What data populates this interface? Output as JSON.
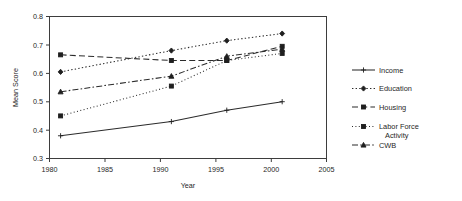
{
  "chart_data": {
    "type": "line",
    "title": "",
    "subtitle": "",
    "xlabel": "Year",
    "ylabel": "Mean Score",
    "x": [
      1981,
      1991,
      1996,
      2001
    ],
    "xlim": [
      1980,
      2005
    ],
    "ylim": [
      0.3,
      0.8
    ],
    "xticks": [
      1980,
      1985,
      1990,
      1995,
      2000,
      2005
    ],
    "yticks": [
      0.3,
      0.4,
      0.5,
      0.6,
      0.7,
      0.8
    ],
    "xtick_labels": [
      "1980",
      "1985",
      "1990",
      "1995",
      "2000",
      "2005"
    ],
    "ytick_labels": [
      "0.3",
      "0.4",
      "0.5",
      "0.6",
      "0.7",
      "0.8"
    ],
    "grid": false,
    "legend_position": "right",
    "series": [
      {
        "name": "Income",
        "values": [
          0.38,
          0.43,
          0.47,
          0.5
        ],
        "line_style": "solid",
        "marker": "plus",
        "color": "#2b2b2b"
      },
      {
        "name": "Education",
        "values": [
          0.605,
          0.68,
          0.715,
          0.74
        ],
        "line_style": "dotted",
        "marker": "diamond",
        "color": "#2b2b2b"
      },
      {
        "name": "Housing",
        "values": [
          0.665,
          0.645,
          0.645,
          0.695
        ],
        "line_style": "long-dash",
        "marker": "square",
        "color": "#2b2b2b"
      },
      {
        "name": "Labor Force Activity",
        "values": [
          0.45,
          0.555,
          0.645,
          0.67
        ],
        "line_style": "fine-dotted",
        "marker": "square",
        "color": "#2b2b2b"
      },
      {
        "name": "CWB",
        "values": [
          0.535,
          0.59,
          0.66,
          0.685
        ],
        "line_style": "dash-dot",
        "marker": "triangle",
        "color": "#2b2b2b"
      }
    ]
  },
  "axes": {
    "y_title": "Mean Score",
    "x_title": "Year",
    "y_ticks": [
      "0.8",
      "0.7",
      "0.6",
      "0.5",
      "0.4",
      "0.3"
    ],
    "x_ticks": [
      "1980",
      "1985",
      "1990",
      "1995",
      "2000",
      "2005"
    ]
  },
  "legend": {
    "items": [
      {
        "label": "Income"
      },
      {
        "label": "Education"
      },
      {
        "label": "Housing"
      },
      {
        "label": "Labor Force"
      },
      {
        "label": "Activity"
      },
      {
        "label": "CWB"
      }
    ]
  }
}
